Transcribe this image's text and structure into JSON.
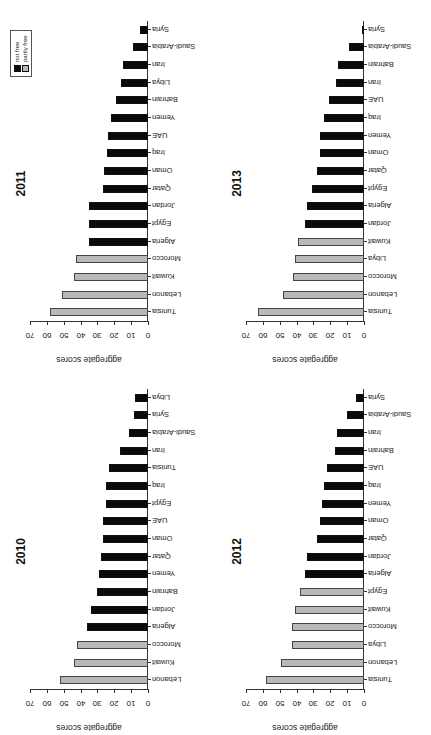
{
  "figure": {
    "orientation": "rotated 90 degrees",
    "legend": {
      "items": [
        {
          "label": "not free",
          "color": "#0a0a0a"
        },
        {
          "label": "partly free",
          "color": "#b8b8b8"
        }
      ]
    }
  },
  "chart_data": [
    {
      "type": "bar",
      "title": "2010",
      "xlabel": "",
      "ylabel": "aggregate scores",
      "ylim": [
        0,
        70
      ],
      "yticks": [
        0,
        10,
        20,
        30,
        40,
        50,
        60,
        70
      ],
      "categories": [
        "Lebanon",
        "Kuwait",
        "Morocco",
        "Algeria",
        "Jordan",
        "Bahrain",
        "Yemen",
        "Qatar",
        "Oman",
        "UAE",
        "Egypt",
        "Iraq",
        "Tunisia",
        "Iran",
        "Saudi-Arabia",
        "Syria",
        "Libya"
      ],
      "values": [
        52,
        44,
        42,
        36,
        34,
        30,
        29,
        28,
        27,
        27,
        25,
        25,
        23,
        16.5,
        11.5,
        8.5,
        7.5
      ],
      "status": [
        "partly free",
        "partly free",
        "partly free",
        "not free",
        "not free",
        "not free",
        "not free",
        "not free",
        "not free",
        "not free",
        "not free",
        "not free",
        "not free",
        "not free",
        "not free",
        "not free",
        "not free"
      ]
    },
    {
      "type": "bar",
      "title": "2011",
      "xlabel": "",
      "ylabel": "aggregate scores",
      "ylim": [
        0,
        70
      ],
      "yticks": [
        0,
        10,
        20,
        30,
        40,
        50,
        60,
        70
      ],
      "categories": [
        "Tunisia",
        "Lebanon",
        "Kuwait",
        "Morocco",
        "Algeria",
        "Egypt",
        "Jordan",
        "Qatar",
        "Oman",
        "Iraq",
        "UAE",
        "Yemen",
        "Bahrain",
        "Libya",
        "Iran",
        "Saudi-Arabia",
        "Syria"
      ],
      "values": [
        58,
        51,
        44,
        43,
        35,
        35,
        35,
        27,
        26,
        24.5,
        23.5,
        22,
        19,
        16,
        15,
        9,
        5
      ],
      "status": [
        "partly free",
        "partly free",
        "partly free",
        "partly free",
        "not free",
        "not free",
        "not free",
        "not free",
        "not free",
        "not free",
        "not free",
        "not free",
        "not free",
        "not free",
        "not free",
        "not free",
        "not free"
      ],
      "legend": [
        "not free",
        "partly free"
      ]
    },
    {
      "type": "bar",
      "title": "2012",
      "xlabel": "",
      "ylabel": "aggregate scores",
      "ylim": [
        0,
        70
      ],
      "yticks": [
        0,
        10,
        20,
        30,
        40,
        50,
        60,
        70
      ],
      "categories": [
        "Tunisia",
        "Lebanon",
        "Libya",
        "Morocco",
        "Kuwait",
        "Egypt",
        "Algeria",
        "Jordan",
        "Qatar",
        "Oman",
        "Yemen",
        "Iraq",
        "UAE",
        "Bahrain",
        "Iran",
        "Saudi-Arabia",
        "Syria"
      ],
      "values": [
        58,
        49,
        43,
        43,
        41,
        38,
        35,
        34,
        28,
        26,
        25,
        24,
        22,
        17.5,
        16,
        10,
        4.5
      ],
      "status": [
        "partly free",
        "partly free",
        "partly free",
        "partly free",
        "partly free",
        "partly free",
        "not free",
        "not free",
        "not free",
        "not free",
        "not free",
        "not free",
        "not free",
        "not free",
        "not free",
        "not free",
        "not free"
      ]
    },
    {
      "type": "bar",
      "title": "2013",
      "xlabel": "",
      "ylabel": "aggregate scores",
      "ylim": [
        0,
        70
      ],
      "yticks": [
        0,
        10,
        20,
        30,
        40,
        50,
        60,
        70
      ],
      "categories": [
        "Tunisia",
        "Lebanon",
        "Morocco",
        "Libya",
        "Kuwait",
        "Jordan",
        "Algeria",
        "Egypt",
        "Qatar",
        "Oman",
        "Yemen",
        "Iraq",
        "UAE",
        "Iran",
        "Bahrain",
        "Saudi-Arabia",
        "Syria"
      ],
      "values": [
        63,
        48,
        42,
        41,
        39,
        35,
        34,
        31,
        28,
        26,
        26,
        24,
        20.5,
        16.5,
        15.5,
        9,
        1
      ],
      "status": [
        "partly free",
        "partly free",
        "partly free",
        "partly free",
        "partly free",
        "not free",
        "not free",
        "not free",
        "not free",
        "not free",
        "not free",
        "not free",
        "not free",
        "not free",
        "not free",
        "not free",
        "not free"
      ]
    }
  ]
}
